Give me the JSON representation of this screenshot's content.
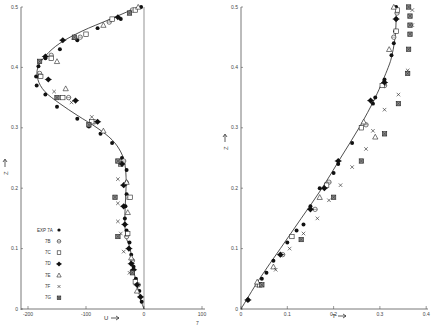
{
  "figure": {
    "background": "#ffffff",
    "ink": "#222222",
    "footer_mark": "7"
  },
  "chart_data": [
    {
      "type": "scatter",
      "title": "",
      "xlabel": "U",
      "ylabel": "Z",
      "xlim": [
        -210,
        110
      ],
      "ylim": [
        0,
        0.5
      ],
      "xticks": [
        -200,
        -100,
        0,
        100
      ],
      "xtick_labels": [
        "-200",
        "-100",
        "0",
        "100"
      ],
      "yticks": [
        0,
        0.1,
        0.2,
        0.3,
        0.4,
        0.5
      ],
      "ytick_labels": [
        "0",
        "0.1",
        "0.2",
        "0.3",
        "0.4",
        "0.5"
      ],
      "grid": false,
      "reference_line": {
        "x": 0
      },
      "legend_position": "lower-left",
      "legend": [
        {
          "label": "EXP 7A",
          "marker": "filled-circle"
        },
        {
          "label": "7B",
          "marker": "open-circle"
        },
        {
          "label": "7C",
          "marker": "open-square"
        },
        {
          "label": "7D",
          "marker": "filled-diamond-cross"
        },
        {
          "label": "7E",
          "marker": "open-triangle"
        },
        {
          "label": "7F",
          "marker": "x"
        },
        {
          "label": "7G",
          "marker": "hatched-square"
        }
      ],
      "curve": {
        "name": "theory",
        "z": [
          0.5,
          0.48,
          0.46,
          0.44,
          0.42,
          0.4,
          0.38,
          0.36,
          0.34,
          0.32,
          0.3,
          0.28,
          0.26,
          0.24,
          0.22,
          0.2,
          0.15,
          0.12,
          0.1,
          0.06,
          0.02,
          0.0
        ],
        "u": [
          -10,
          -58,
          -107,
          -145,
          -169,
          -183,
          -183,
          -171,
          -145,
          -114,
          -81,
          -55,
          -40,
          -33,
          -31,
          -31,
          -33,
          -31,
          -24,
          -17,
          -7,
          0
        ]
      },
      "series": [
        {
          "name": "EXP 7A",
          "marker": "filled-circle",
          "points": [
            [
              -5,
              0.5
            ],
            [
              -40,
              0.48
            ],
            [
              -80,
              0.465
            ],
            [
              -115,
              0.445
            ],
            [
              -145,
              0.43
            ],
            [
              -170,
              0.415
            ],
            [
              -182,
              0.402
            ],
            [
              -186,
              0.385
            ],
            [
              -185,
              0.37
            ],
            [
              -170,
              0.355
            ],
            [
              -150,
              0.335
            ],
            [
              -115,
              0.315
            ],
            [
              -95,
              0.302
            ],
            [
              -75,
              0.29
            ],
            [
              -55,
              0.275
            ],
            [
              -38,
              0.25
            ],
            [
              -30,
              0.23
            ],
            [
              -30,
              0.21
            ],
            [
              -30,
              0.19
            ],
            [
              -32,
              0.17
            ],
            [
              -33,
              0.15
            ],
            [
              -30,
              0.13
            ],
            [
              -25,
              0.11
            ],
            [
              -22,
              0.09
            ],
            [
              -18,
              0.07
            ],
            [
              -14,
              0.05
            ],
            [
              -8,
              0.03
            ],
            [
              -4,
              0.012
            ]
          ]
        },
        {
          "name": "7B",
          "marker": "open-circle",
          "points": [
            [
              -20,
              0.495
            ],
            [
              -60,
              0.475
            ],
            [
              -110,
              0.45
            ],
            [
              -160,
              0.42
            ],
            [
              -180,
              0.39
            ],
            [
              -130,
              0.35
            ],
            [
              -85,
              0.31
            ],
            [
              -35,
              0.245
            ],
            [
              -28,
              0.185
            ],
            [
              -30,
              0.12
            ],
            [
              -20,
              0.08
            ],
            [
              -10,
              0.04
            ]
          ]
        },
        {
          "name": "7C",
          "marker": "open-square",
          "points": [
            [
              -15,
              0.495
            ],
            [
              -55,
              0.48
            ],
            [
              -100,
              0.455
            ],
            [
              -160,
              0.415
            ],
            [
              -178,
              0.385
            ],
            [
              -140,
              0.35
            ],
            [
              -90,
              0.31
            ],
            [
              -40,
              0.24
            ],
            [
              -24,
              0.185
            ],
            [
              -28,
              0.125
            ],
            [
              -15,
              0.045
            ]
          ]
        },
        {
          "name": "7D",
          "marker": "filled-diamond-cross",
          "points": [
            [
              -45,
              0.483
            ],
            [
              -140,
              0.445
            ],
            [
              -170,
              0.418
            ],
            [
              -165,
              0.38
            ],
            [
              -118,
              0.345
            ],
            [
              -80,
              0.31
            ],
            [
              -38,
              0.24
            ],
            [
              -35,
              0.205
            ],
            [
              -35,
              0.17
            ],
            [
              -33,
              0.14
            ],
            [
              -26,
              0.1
            ],
            [
              -22,
              0.075
            ],
            [
              -18,
              0.065
            ],
            [
              -12,
              0.04
            ],
            [
              -6,
              0.02
            ]
          ]
        },
        {
          "name": "7E",
          "marker": "open-triangle",
          "points": [
            [
              -10,
              0.5
            ],
            [
              -70,
              0.47
            ],
            [
              -120,
              0.45
            ],
            [
              -150,
              0.41
            ],
            [
              -135,
              0.365
            ],
            [
              -70,
              0.295
            ],
            [
              -30,
              0.21
            ],
            [
              -28,
              0.16
            ],
            [
              -22,
              0.085
            ],
            [
              -12,
              0.03
            ]
          ]
        },
        {
          "name": "7F",
          "marker": "x",
          "points": [
            [
              -155,
              0.36
            ],
            [
              -125,
              0.342
            ],
            [
              -90,
              0.318
            ],
            [
              -40,
              0.24
            ],
            [
              -45,
              0.215
            ],
            [
              -45,
              0.175
            ],
            [
              -45,
              0.145
            ],
            [
              -40,
              0.125
            ],
            [
              -35,
              0.095
            ],
            [
              -25,
              0.06
            ]
          ]
        },
        {
          "name": "7G",
          "marker": "hatched-square",
          "points": [
            [
              -25,
              0.49
            ],
            [
              -120,
              0.45
            ],
            [
              -180,
              0.41
            ],
            [
              -150,
              0.35
            ],
            [
              -95,
              0.305
            ],
            [
              -45,
              0.245
            ],
            [
              -50,
              0.185
            ],
            [
              -45,
              0.12
            ],
            [
              -20,
              0.06
            ]
          ]
        }
      ]
    },
    {
      "type": "scatter",
      "title": "",
      "xlabel": "T",
      "ylabel": "Z",
      "xlim": [
        0,
        0.4
      ],
      "ylim": [
        0,
        0.5
      ],
      "xticks": [
        0,
        0.1,
        0.2,
        0.3,
        0.4
      ],
      "xtick_labels": [
        "0",
        "0.1",
        "0.2",
        "0.3",
        "0.4"
      ],
      "yticks": [
        0,
        0.1,
        0.2,
        0.3,
        0.4,
        0.5
      ],
      "ytick_labels": [
        "0",
        "0.1",
        "0.2",
        "0.3",
        "0.4",
        "0.5"
      ],
      "grid": false,
      "curve": {
        "name": "theory",
        "z": [
          0.0,
          0.05,
          0.1,
          0.15,
          0.2,
          0.25,
          0.3,
          0.35,
          0.4,
          0.42,
          0.44,
          0.46,
          0.48,
          0.5
        ],
        "t": [
          0.0,
          0.04,
          0.085,
          0.13,
          0.175,
          0.215,
          0.255,
          0.29,
          0.318,
          0.326,
          0.331,
          0.334,
          0.335,
          0.335
        ]
      },
      "series": [
        {
          "name": "EXP 7A",
          "marker": "filled-circle",
          "points": [
            [
              0.015,
              0.015
            ],
            [
              0.045,
              0.05
            ],
            [
              0.055,
              0.06
            ],
            [
              0.07,
              0.08
            ],
            [
              0.1,
              0.11
            ],
            [
              0.12,
              0.13
            ],
            [
              0.135,
              0.14
            ],
            [
              0.15,
              0.17
            ],
            [
              0.17,
              0.2
            ],
            [
              0.2,
              0.225
            ],
            [
              0.21,
              0.24
            ],
            [
              0.24,
              0.275
            ],
            [
              0.26,
              0.3
            ],
            [
              0.285,
              0.34
            ],
            [
              0.29,
              0.35
            ],
            [
              0.31,
              0.38
            ],
            [
              0.325,
              0.42
            ],
            [
              0.33,
              0.44
            ],
            [
              0.333,
              0.46
            ],
            [
              0.335,
              0.48
            ],
            [
              0.335,
              0.5
            ]
          ]
        },
        {
          "name": "7B",
          "marker": "open-circle",
          "points": [
            [
              0.035,
              0.04
            ],
            [
              0.09,
              0.09
            ],
            [
              0.16,
              0.165
            ],
            [
              0.19,
              0.21
            ],
            [
              0.27,
              0.305
            ],
            [
              0.31,
              0.37
            ],
            [
              0.33,
              0.45
            ],
            [
              0.337,
              0.49
            ]
          ]
        },
        {
          "name": "7C",
          "marker": "open-square",
          "points": [
            [
              0.04,
              0.04
            ],
            [
              0.11,
              0.12
            ],
            [
              0.185,
              0.205
            ],
            [
              0.26,
              0.3
            ],
            [
              0.305,
              0.37
            ],
            [
              0.335,
              0.46
            ],
            [
              0.338,
              0.495
            ]
          ]
        },
        {
          "name": "7D",
          "marker": "filled-diamond-cross",
          "points": [
            [
              0.015,
              0.015
            ],
            [
              0.085,
              0.09
            ],
            [
              0.15,
              0.165
            ],
            [
              0.18,
              0.2
            ],
            [
              0.21,
              0.245
            ],
            [
              0.28,
              0.345
            ],
            [
              0.31,
              0.375
            ],
            [
              0.335,
              0.48
            ]
          ]
        },
        {
          "name": "7E",
          "marker": "open-triangle",
          "points": [
            [
              0.035,
              0.045
            ],
            [
              0.07,
              0.07
            ],
            [
              0.17,
              0.185
            ],
            [
              0.265,
              0.31
            ],
            [
              0.29,
              0.285
            ],
            [
              0.32,
              0.43
            ],
            [
              0.33,
              0.5
            ]
          ]
        },
        {
          "name": "7F",
          "marker": "x",
          "points": [
            [
              0.075,
              0.065
            ],
            [
              0.105,
              0.1
            ],
            [
              0.135,
              0.125
            ],
            [
              0.165,
              0.15
            ],
            [
              0.19,
              0.18
            ],
            [
              0.215,
              0.205
            ],
            [
              0.24,
              0.235
            ],
            [
              0.27,
              0.265
            ],
            [
              0.285,
              0.295
            ],
            [
              0.31,
              0.33
            ],
            [
              0.34,
              0.355
            ],
            [
              0.36,
              0.395
            ],
            [
              0.37,
              0.47
            ],
            [
              0.37,
              0.495
            ]
          ]
        },
        {
          "name": "7G",
          "marker": "hatched-square",
          "points": [
            [
              0.045,
              0.04
            ],
            [
              0.13,
              0.115
            ],
            [
              0.2,
              0.185
            ],
            [
              0.26,
              0.245
            ],
            [
              0.31,
              0.29
            ],
            [
              0.34,
              0.34
            ],
            [
              0.36,
              0.39
            ],
            [
              0.362,
              0.43
            ],
            [
              0.365,
              0.455
            ],
            [
              0.365,
              0.47
            ],
            [
              0.365,
              0.485
            ],
            [
              0.362,
              0.5
            ]
          ]
        }
      ]
    }
  ]
}
